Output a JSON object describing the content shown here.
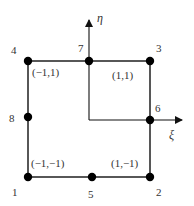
{
  "diagram": {
    "type": "quadratic-serendipity-element",
    "colors": {
      "stroke": "#111111",
      "node": "#000000",
      "text": "#333333"
    },
    "axes": {
      "eta": {
        "label": "η",
        "origin": [
          89,
          120
        ],
        "tip": [
          89,
          18
        ]
      },
      "xi": {
        "label": "ξ",
        "origin": [
          89,
          120
        ],
        "tip": [
          183,
          120
        ]
      }
    },
    "element_corners": {
      "x_min": 28,
      "x_max": 150,
      "y_min": 61,
      "y_max": 177
    },
    "nodes": [
      {
        "id": "1",
        "x": 28,
        "y": 177,
        "label_x": 14,
        "label_y": 195
      },
      {
        "id": "2",
        "x": 150,
        "y": 177,
        "label_x": 157,
        "label_y": 195
      },
      {
        "id": "3",
        "x": 150,
        "y": 61,
        "label_x": 157,
        "label_y": 50
      },
      {
        "id": "4",
        "x": 28,
        "y": 61,
        "label_x": 11,
        "label_y": 52
      },
      {
        "id": "5",
        "x": 92,
        "y": 177,
        "label_x": 88,
        "label_y": 197
      },
      {
        "id": "6",
        "x": 150,
        "y": 120,
        "label_x": 157,
        "label_y": 111
      },
      {
        "id": "7",
        "x": 89,
        "y": 61,
        "label_x": 78,
        "label_y": 50
      },
      {
        "id": "8",
        "x": 28,
        "y": 117,
        "label_x": 10,
        "label_y": 121
      }
    ],
    "coord_labels": [
      {
        "text": "(−1,1)",
        "x": 32,
        "y": 76
      },
      {
        "text": "(1,1)",
        "x": 113,
        "y": 79
      },
      {
        "text": "(−1,−1)",
        "x": 31,
        "y": 166
      },
      {
        "text": "(1,−1)",
        "x": 111,
        "y": 166
      }
    ]
  }
}
